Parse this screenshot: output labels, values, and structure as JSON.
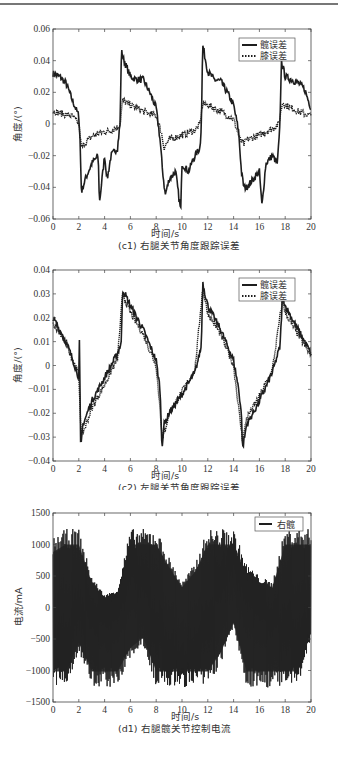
{
  "chart_data": [
    {
      "type": "line",
      "id": "c1",
      "title": "(c1) 右腿关节角度跟踪误差",
      "xlabel": "时间/s",
      "ylabel": "角度/(°)",
      "xlim": [
        0,
        20
      ],
      "ylim": [
        -0.06,
        0.06
      ],
      "xticks": [
        0,
        2,
        4,
        6,
        8,
        10,
        12,
        14,
        16,
        18,
        20
      ],
      "yticks": [
        -0.06,
        -0.04,
        -0.02,
        0,
        0.02,
        0.04,
        0.06
      ],
      "ytick_labels": [
        "-0.06",
        "-0.04",
        "-0.02",
        "0",
        "0.02",
        "0.04",
        "0.06"
      ],
      "grid": false,
      "legend_position": "upper right",
      "series": [
        {
          "name": "髋误差",
          "style": "solid",
          "x": [
            0,
            0.5,
            1,
            1.5,
            2,
            2.1,
            2.2,
            2.5,
            3,
            3.5,
            3.6,
            4,
            4.2,
            4.5,
            5,
            5.2,
            5.3,
            5.5,
            6,
            6.5,
            7,
            7.5,
            8,
            8.3,
            8.5,
            8.7,
            9,
            9.5,
            9.9,
            10,
            10.5,
            11,
            11.4,
            11.5,
            11.6,
            12,
            12.5,
            13,
            13.5,
            14,
            14.4,
            14.6,
            14.8,
            15,
            15.5,
            16,
            16.2,
            16.5,
            17,
            17.4,
            17.6,
            17.7,
            18,
            18.5,
            19,
            19.5,
            20
          ],
          "values": [
            0.032,
            0.03,
            0.026,
            0.015,
            0.005,
            -0.01,
            -0.043,
            -0.035,
            -0.025,
            -0.02,
            -0.05,
            -0.02,
            -0.035,
            -0.02,
            -0.015,
            0.0,
            0.046,
            0.04,
            0.03,
            0.028,
            0.028,
            0.02,
            0.01,
            -0.01,
            -0.03,
            -0.045,
            -0.035,
            -0.03,
            -0.055,
            -0.025,
            -0.03,
            -0.02,
            -0.015,
            0.0,
            0.05,
            0.033,
            0.028,
            0.027,
            0.02,
            0.012,
            -0.005,
            -0.03,
            -0.04,
            -0.04,
            -0.035,
            -0.03,
            -0.052,
            -0.025,
            -0.02,
            -0.025,
            0.0,
            0.04,
            0.03,
            0.028,
            0.026,
            0.022,
            0.01
          ]
        },
        {
          "name": "膝误差",
          "style": "dotted",
          "x": [
            0,
            0.5,
            1,
            1.5,
            2,
            2.2,
            2.5,
            3,
            3.5,
            4,
            4.5,
            5,
            5.2,
            5.4,
            6,
            7,
            8,
            8.4,
            8.6,
            9,
            10,
            11,
            11.4,
            11.6,
            12,
            13,
            14,
            14.5,
            14.8,
            15,
            16,
            17,
            17.5,
            17.8,
            18,
            19,
            20
          ],
          "values": [
            0.008,
            0.007,
            0.006,
            0.005,
            0.0,
            -0.015,
            -0.012,
            -0.008,
            -0.006,
            -0.005,
            -0.004,
            -0.002,
            0.0,
            0.015,
            0.012,
            0.008,
            0.005,
            -0.005,
            -0.015,
            -0.01,
            -0.007,
            -0.004,
            0.0,
            0.013,
            0.012,
            0.008,
            0.003,
            -0.01,
            -0.013,
            -0.01,
            -0.007,
            -0.003,
            0.0,
            0.014,
            0.012,
            0.008,
            0.005
          ]
        }
      ]
    },
    {
      "type": "line",
      "id": "c2",
      "title": "(c2) 左腿关节角度跟踪误差",
      "xlabel": "时间/s",
      "ylabel": "角度/(°)",
      "xlim": [
        0,
        20
      ],
      "ylim": [
        -0.04,
        0.04
      ],
      "xticks": [
        0,
        2,
        4,
        6,
        8,
        10,
        12,
        14,
        16,
        18,
        20
      ],
      "yticks": [
        -0.04,
        -0.03,
        -0.02,
        -0.01,
        0,
        0.01,
        0.02,
        0.03,
        0.04
      ],
      "ytick_labels": [
        "-0.04",
        "-0.03",
        "-0.02",
        "-0.01",
        "0",
        "0.01",
        "0.02",
        "0.03",
        "0.04"
      ],
      "grid": false,
      "legend_position": "upper right",
      "series": [
        {
          "name": "髋误差",
          "style": "solid",
          "x": [
            0,
            0.5,
            1,
            1.5,
            2,
            2.05,
            2.15,
            2.3,
            3,
            4,
            5,
            5.3,
            5.4,
            6,
            7,
            8,
            8.3,
            8.45,
            8.6,
            9,
            10,
            11,
            11.5,
            11.6,
            12,
            13,
            14,
            14.4,
            14.6,
            14.7,
            15,
            16,
            17,
            17.6,
            17.8,
            18,
            19,
            20
          ],
          "values": [
            0.02,
            0.015,
            0.01,
            0.003,
            -0.005,
            0.01,
            -0.036,
            -0.025,
            -0.015,
            -0.005,
            0.005,
            0.01,
            0.032,
            0.025,
            0.015,
            0.002,
            -0.01,
            -0.034,
            -0.025,
            -0.02,
            -0.012,
            -0.003,
            0.008,
            0.035,
            0.025,
            0.015,
            0.002,
            -0.01,
            -0.02,
            -0.035,
            -0.025,
            -0.015,
            -0.003,
            0.008,
            0.03,
            0.025,
            0.015,
            0.005
          ]
        },
        {
          "name": "膝误差",
          "style": "dotted",
          "x": [
            0,
            1,
            2,
            2.2,
            3,
            4,
            5,
            5.4,
            6,
            7,
            8,
            8.5,
            9,
            10,
            11,
            11.6,
            12,
            13,
            14,
            14.7,
            15,
            16,
            17,
            17.8,
            18,
            19,
            20
          ],
          "values": [
            0.017,
            0.01,
            -0.004,
            -0.03,
            -0.018,
            -0.008,
            0.003,
            0.03,
            0.022,
            0.013,
            0.0,
            -0.031,
            -0.02,
            -0.011,
            -0.002,
            0.032,
            0.022,
            0.013,
            0.0,
            -0.032,
            -0.022,
            -0.013,
            -0.002,
            0.028,
            0.022,
            0.013,
            0.004
          ]
        }
      ]
    },
    {
      "type": "line",
      "id": "d1",
      "title": "(d1) 右腿髋关节控制电流",
      "xlabel": "时间/s",
      "ylabel": "电流/mA",
      "xlim": [
        0,
        20
      ],
      "ylim": [
        -1500,
        1500
      ],
      "xticks": [
        0,
        2,
        4,
        6,
        8,
        10,
        12,
        14,
        16,
        18,
        20
      ],
      "yticks": [
        -1500,
        -1000,
        -500,
        0,
        500,
        1000,
        1500
      ],
      "ytick_labels": [
        "-1500",
        "-1000",
        "-500",
        "0",
        "500",
        "1000",
        "1500"
      ],
      "grid": false,
      "legend_position": "upper right",
      "saturation_limits": [
        -1270,
        1250
      ],
      "series": [
        {
          "name": "右髋",
          "style": "solid",
          "note": "high-frequency oscillating current saturating at ±1250 mA; envelope given",
          "x": [
            0,
            1,
            2,
            3,
            4,
            5,
            6,
            7,
            8,
            9,
            10,
            11,
            12,
            13,
            14,
            15,
            16,
            17,
            18,
            19,
            20
          ],
          "envelope_upper": [
            1100,
            1250,
            1250,
            500,
            200,
            300,
            1250,
            1250,
            1250,
            800,
            400,
            700,
            1250,
            1250,
            1250,
            700,
            500,
            400,
            1250,
            1250,
            1250
          ],
          "envelope_lower": [
            -1270,
            -1270,
            -700,
            -1270,
            -1270,
            -1270,
            -800,
            -600,
            -1270,
            -1270,
            -1270,
            -1270,
            -1270,
            -900,
            -300,
            -1270,
            -1270,
            -1270,
            -1270,
            -1270,
            -500
          ]
        }
      ]
    }
  ],
  "plots": {
    "c1": {
      "caption": "(c1) 右腿关节角度跟踪误差",
      "xlabel": "时间/s",
      "ylabel": "角度/(°)",
      "legend": [
        "髋误差",
        "膝误差"
      ],
      "xticks": [
        "0",
        "2",
        "4",
        "6",
        "8",
        "10",
        "12",
        "14",
        "16",
        "18",
        "20"
      ],
      "yticks": [
        "0.06",
        "0.04",
        "0.02",
        "0",
        "−0.02",
        "−0.04",
        "−0.06"
      ]
    },
    "c2": {
      "caption": "(c2) 左腿关节角度跟踪误差",
      "xlabel": "时间/s",
      "ylabel": "角度/(°)",
      "legend": [
        "髋误差",
        "膝误差"
      ],
      "xticks": [
        "0",
        "2",
        "4",
        "6",
        "8",
        "10",
        "12",
        "14",
        "16",
        "18",
        "20"
      ],
      "yticks": [
        "0.04",
        "0.03",
        "0.02",
        "0.01",
        "0",
        "−0.01",
        "−0.02",
        "−0.03",
        "−0.04"
      ]
    },
    "d1": {
      "caption": "(d1) 右腿髋关节控制电流",
      "xlabel": "时间/s",
      "ylabel": "电流/mA",
      "legend": [
        "右髋"
      ],
      "xticks": [
        "0",
        "2",
        "4",
        "6",
        "8",
        "10",
        "12",
        "14",
        "16",
        "18",
        "20"
      ],
      "yticks": [
        "1500",
        "1000",
        "500",
        "0",
        "−500",
        "−1000",
        "−1500"
      ]
    }
  },
  "colors": {
    "line": "#1e1e1e",
    "axis": "#444444",
    "text": "#333333"
  }
}
